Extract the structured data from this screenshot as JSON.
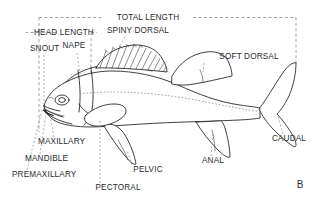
{
  "figure": {
    "panel_label": "B",
    "background_color": "#ffffff",
    "ink_color": "#1d1d1d",
    "guide_color": "#8c8c8c"
  },
  "measurements": [
    {
      "id": "total-length",
      "label": "TOTAL LENGTH",
      "label_x": 148,
      "label_y": 20,
      "anchor": "middle"
    },
    {
      "id": "head-length",
      "label": "HEAD LENGTH",
      "label_x": 64,
      "label_y": 35,
      "anchor": "middle"
    }
  ],
  "parts": [
    {
      "id": "snout",
      "label": "SNOUT",
      "label_x": 30,
      "label_y": 51,
      "anchor": "start"
    },
    {
      "id": "nape",
      "label": "NAPE",
      "label_x": 74,
      "label_y": 48,
      "anchor": "middle"
    },
    {
      "id": "spiny-dorsal",
      "label": "SPINY DORSAL",
      "label_x": 138,
      "label_y": 33,
      "anchor": "middle"
    },
    {
      "id": "soft-dorsal",
      "label": "SOFT DORSAL",
      "label_x": 249,
      "label_y": 59,
      "anchor": "middle"
    },
    {
      "id": "caudal",
      "label": "CAUDAL",
      "label_x": 289,
      "label_y": 141,
      "anchor": "middle"
    },
    {
      "id": "anal",
      "label": "ANAL",
      "label_x": 213,
      "label_y": 163,
      "anchor": "middle"
    },
    {
      "id": "pelvic",
      "label": "PELVIC",
      "label_x": 148,
      "label_y": 172,
      "anchor": "middle"
    },
    {
      "id": "pectoral",
      "label": "PECTORAL",
      "label_x": 118,
      "label_y": 190,
      "anchor": "middle"
    },
    {
      "id": "maxillary",
      "label": "MAXILLARY",
      "label_x": 38,
      "label_y": 144,
      "anchor": "start"
    },
    {
      "id": "mandible",
      "label": "MANDIBLE",
      "label_x": 25,
      "label_y": 161,
      "anchor": "start"
    },
    {
      "id": "premaxillary",
      "label": "PREMAXILLARY",
      "label_x": 12,
      "label_y": 177,
      "anchor": "start"
    }
  ]
}
